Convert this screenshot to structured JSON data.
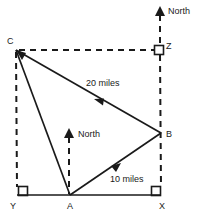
{
  "diagram": {
    "background_color": "#ffffff",
    "stroke_color": "#1a1a1a",
    "vertices": [
      {
        "id": "C",
        "label": "C",
        "x": 16,
        "y": 50,
        "label_x": 9,
        "label_y": 44
      },
      {
        "id": "Z",
        "label": "Z",
        "x": 160,
        "y": 50,
        "label_x": 167,
        "label_y": 48
      },
      {
        "id": "B",
        "label": "B",
        "x": 161,
        "y": 133,
        "label_x": 167,
        "label_y": 136
      },
      {
        "id": "Y",
        "label": "Y",
        "x": 17,
        "y": 195,
        "label_x": 11,
        "label_y": 207
      },
      {
        "id": "A",
        "label": "A",
        "x": 70,
        "y": 195,
        "label_x": 66,
        "label_y": 207
      },
      {
        "id": "X",
        "label": "X",
        "x": 161,
        "y": 195,
        "label_x": 157,
        "label_y": 207
      }
    ],
    "measures": [
      {
        "id": "cb",
        "label": "20 miles",
        "label_x": 86,
        "label_y": 86
      },
      {
        "id": "ab",
        "label": "10 miles",
        "label_x": 110,
        "label_y": 182
      }
    ],
    "north_markers": [
      {
        "id": "north-top",
        "label": "North",
        "label_x": 168,
        "label_y": 14,
        "x": 160,
        "tip_y": 7,
        "base_y": 50
      },
      {
        "id": "north-middle",
        "label": "North",
        "label_x": 78,
        "label_y": 137,
        "x": 69,
        "tip_y": 129,
        "base_y": 195
      }
    ],
    "right_angle_marks": [
      {
        "id": "angle-y",
        "x": 18,
        "y": 186,
        "size": 9
      },
      {
        "id": "angle-x",
        "x": 152,
        "y": 186,
        "size": 9
      },
      {
        "id": "angle-z",
        "x": 155,
        "y": 45,
        "size": 9
      }
    ],
    "solid_segments": [
      {
        "id": "segment-CA",
        "x1": 16,
        "y1": 50,
        "x2": 70,
        "y2": 195
      },
      {
        "id": "segment-CB",
        "x1": 16,
        "y1": 50,
        "x2": 161,
        "y2": 133
      },
      {
        "id": "segment-AB",
        "x1": 70,
        "y1": 195,
        "x2": 161,
        "y2": 133
      },
      {
        "id": "segment-YX",
        "x1": 17,
        "y1": 195,
        "x2": 161,
        "y2": 195
      }
    ],
    "dashed_segments": [
      {
        "id": "dashed-CY",
        "x1": 16,
        "y1": 51,
        "x2": 17,
        "y2": 188
      },
      {
        "id": "dashed-CZ",
        "x1": 18,
        "y1": 50,
        "x2": 155,
        "y2": 50
      },
      {
        "id": "dashed-ZX",
        "x1": 160,
        "y1": 54,
        "x2": 161,
        "y2": 188
      },
      {
        "id": "dashed-north-top",
        "x1": 160,
        "y1": 14,
        "x2": 160,
        "y2": 45
      }
    ],
    "direction_arrows": [
      {
        "id": "arrow-B-to-C",
        "x": 97,
        "y": 100,
        "angle": 210
      },
      {
        "id": "arrow-A-to-B",
        "x": 117,
        "y": 167,
        "angle": 326
      },
      {
        "id": "arrow-C-corner",
        "x": 16,
        "y": 50,
        "angle": 215
      }
    ]
  }
}
